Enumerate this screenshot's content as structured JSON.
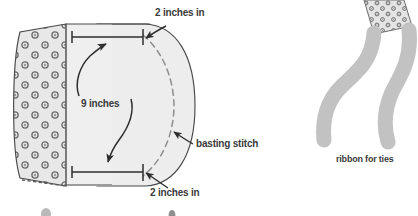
{
  "figure": {
    "canvas": {
      "width": 418,
      "height": 216
    },
    "colors": {
      "fabric_fill": "#e6e6e6",
      "fabric_fill_light": "#eeeeee",
      "outline": "#4a4a4a",
      "dot_ring": "#5a5a5a",
      "dot_center": "#8a8a8a",
      "text": "#3b3b3b",
      "basting_dash": "#8e8e8e",
      "ribbon": "#bfbfbf",
      "background": "#ffffff"
    }
  },
  "labels": {
    "top_measure": "2 inches in",
    "bottom_measure": "2 inches in",
    "height_measure": "9 inches",
    "basting": "basting stitch",
    "ribbon": "ribbon for ties"
  },
  "annotations": [
    {
      "id": "top-2in",
      "text": "2 inches in",
      "x": 155,
      "y": 16,
      "anchor": "start"
    },
    {
      "id": "height-9in",
      "text": "9 inches",
      "x": 81,
      "y": 107,
      "anchor": "start"
    },
    {
      "id": "basting",
      "text": "basting stitch",
      "x": 196,
      "y": 147,
      "anchor": "start"
    },
    {
      "id": "bottom-2in",
      "text": "2 inches in",
      "x": 150,
      "y": 196,
      "anchor": "start"
    },
    {
      "id": "ribbon-ties",
      "text": "ribbon for ties",
      "x": 336,
      "y": 162,
      "anchor": "start"
    }
  ],
  "measurements": {
    "top_inset_inches": 2,
    "bottom_inset_inches": 2,
    "panel_height_inches": 9
  },
  "fabric": {
    "pattern": "polka-dot",
    "dot_rows": 9,
    "dot_columns": 4,
    "stagger": true
  },
  "parts": [
    {
      "name": "dotted-fabric-panel",
      "description": "left polka-dot panel"
    },
    {
      "name": "plain-panel",
      "description": "center plain panel"
    },
    {
      "name": "curved-brim",
      "description": "right curved bulge"
    },
    {
      "name": "basting-stitch-line",
      "description": "dashed curve inside brim"
    },
    {
      "name": "ribbon-tie-left",
      "description": "left gray ribbon"
    },
    {
      "name": "ribbon-tie-right",
      "description": "right gray ribbon"
    },
    {
      "name": "dotted-tab",
      "description": "small dotted tab at top right"
    }
  ]
}
